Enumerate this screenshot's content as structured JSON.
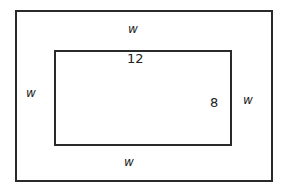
{
  "diagram": {
    "outer_rect": {
      "label_top": "w",
      "label_left": "w",
      "label_right": "w",
      "label_bottom": "w"
    },
    "inner_rect": {
      "width_label": "12",
      "height_label": "8"
    }
  }
}
